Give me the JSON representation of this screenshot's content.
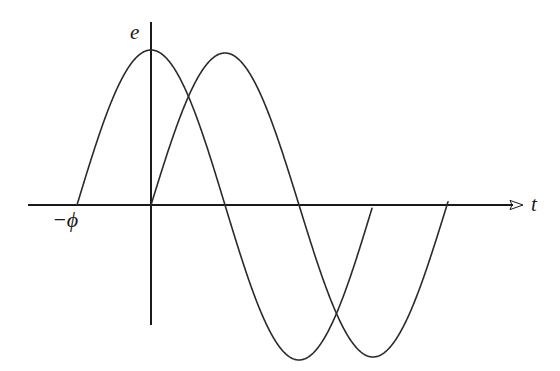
{
  "figure": {
    "title": "",
    "background_color": "#ffffff",
    "line_color": "#2a2a2a",
    "axis_color": "#1a1a1a",
    "width": 560,
    "height": 371
  },
  "labels": {
    "y_axis": "e",
    "x_axis": "t",
    "phase_offset": "−ϕ"
  },
  "chart_data": {
    "type": "line",
    "title": "",
    "xlabel": "t",
    "ylabel": "e",
    "grid": false,
    "legend": "none",
    "annotations": [
      {
        "text": "−ϕ",
        "x_px": 77,
        "y_px": 222,
        "describes": "negative phase offset; x-intercept where the leading wave begins its positive half-cycle"
      }
    ],
    "axes": {
      "x_axis_y_px": 205,
      "x_axis_start_px": 28,
      "x_axis_end_px": 523,
      "x_axis_arrow": true,
      "y_axis_x_px": 151,
      "y_axis_top_px": 22,
      "y_axis_bottom_px": 325,
      "y_axis_arrow": false,
      "origin_px": [
        151,
        205
      ]
    },
    "series": [
      {
        "name": "leading wave",
        "form": "e = E sin(ωt + ϕ)",
        "amplitude_px": 155,
        "period_px": 296,
        "phase_shift_px": -74,
        "zero_crossings_px": [
          77,
          223,
          372
        ],
        "peak_px": [
          151,
          50
        ],
        "trough_px": [
          300,
          358
        ],
        "start_px": 77,
        "end_px": 372
      },
      {
        "name": "reference wave",
        "form": "e = E sin(ωt)",
        "amplitude_px": 152,
        "period_px": 296,
        "phase_shift_px": 0,
        "zero_crossings_px": [
          151,
          298,
          448
        ],
        "peak_px": [
          216,
          53
        ],
        "trough_px": [
          383,
          357
        ],
        "start_px": 151,
        "end_px": 448
      }
    ]
  }
}
